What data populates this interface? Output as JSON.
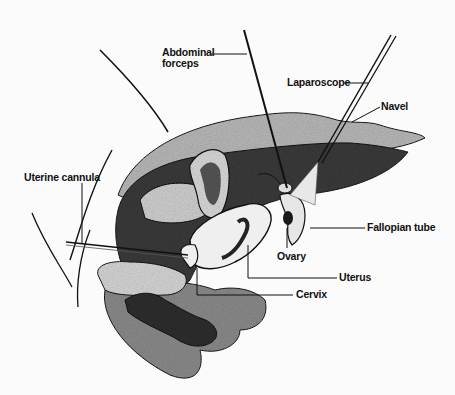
{
  "figure": {
    "type": "anatomical illustration",
    "labels": {
      "abdominal_forceps_line1": "Abdominal",
      "abdominal_forceps_line2": "forceps",
      "laparoscope": "Laparoscope",
      "navel": "Navel",
      "uterine_cannula": "Uterine cannula",
      "fallopian_tube": "Fallopian tube",
      "ovary": "Ovary",
      "uterus": "Uterus",
      "cervix": "Cervix"
    },
    "colors": {
      "background": "#fbfbfb",
      "ink": "#111111",
      "tissue_dark": "#2a2a2a",
      "tissue_mid": "#7a7a7a",
      "tissue_light": "#c9c9c9",
      "organ_fill": "#eeeeee"
    }
  }
}
